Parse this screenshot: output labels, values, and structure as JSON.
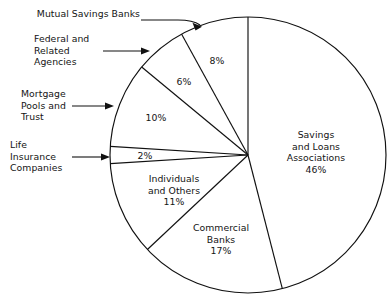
{
  "figure": {
    "background_color": "#ffffff",
    "line_color": "#111111",
    "text_color": "#141414"
  },
  "chart_data": {
    "type": "pie",
    "title": "",
    "xlabel": "",
    "ylabel": "",
    "legend_position": "none",
    "grid": false,
    "start_angle_deg": 0,
    "direction": "clockwise",
    "center": {
      "x": 248,
      "y": 155
    },
    "radius": 138,
    "total_percent": 100,
    "categories": [
      "Savings and Loans Associations",
      "Commercial Banks",
      "Individuals and Others",
      "Life Insurance Companies",
      "Mortgage Pools and Trust",
      "Federal and Related Agencies",
      "Mutual Savings Banks"
    ],
    "values": [
      46,
      17,
      11,
      2,
      10,
      6,
      8
    ],
    "slices": [
      {
        "name": "Savings and Loans Associations",
        "value": 46,
        "percent_label": "46%",
        "label_lines": [
          "Savings",
          "and Loans",
          "Associations",
          "46%"
        ],
        "label_placement": "inside"
      },
      {
        "name": "Commercial Banks",
        "value": 17,
        "percent_label": "17%",
        "label_lines": [
          "Commercial",
          "Banks",
          "17%"
        ],
        "label_placement": "inside"
      },
      {
        "name": "Individuals and Others",
        "value": 11,
        "percent_label": "11%",
        "label_lines": [
          "Individuals",
          "and Others",
          "11%"
        ],
        "label_placement": "inside"
      },
      {
        "name": "Life Insurance Companies",
        "value": 2,
        "percent_label": "2%",
        "label_lines": [
          "2%"
        ],
        "label_placement": "inside-callout",
        "callout_lines": [
          "Life",
          "Insurance",
          "Companies"
        ]
      },
      {
        "name": "Mortgage Pools and Trust",
        "value": 10,
        "percent_label": "10%",
        "label_lines": [
          "10%"
        ],
        "label_placement": "inside-callout",
        "callout_lines": [
          "Mortgage",
          "Pools and",
          "Trust"
        ]
      },
      {
        "name": "Federal and Related Agencies",
        "value": 6,
        "percent_label": "6%",
        "label_lines": [
          "6%"
        ],
        "label_placement": "inside-callout",
        "callout_lines": [
          "Federal and",
          "Related",
          "Agencies"
        ]
      },
      {
        "name": "Mutual Savings Banks",
        "value": 8,
        "percent_label": "8%",
        "label_lines": [
          "8%"
        ],
        "label_placement": "inside-callout",
        "callout_lines": [
          "Mutual Savings Banks"
        ]
      }
    ]
  },
  "callouts": {
    "mutual_savings_banks": {
      "lines": [
        "Mutual Savings Banks"
      ]
    },
    "federal_related_agencies": {
      "lines": [
        "Federal and",
        "Related",
        "Agencies"
      ]
    },
    "mortgage_pools_trust": {
      "lines": [
        "Mortgage",
        "Pools and",
        "Trust"
      ]
    },
    "life_insurance_companies": {
      "lines": [
        "Life",
        "Insurance",
        "Companies"
      ]
    }
  },
  "inside_labels": {
    "savings_loans": {
      "lines": [
        "Savings",
        "and Loans",
        "Associations",
        "46%"
      ]
    },
    "commercial_banks": {
      "lines": [
        "Commercial",
        "Banks",
        "17%"
      ]
    },
    "individuals_others": {
      "lines": [
        "Individuals",
        "and Others",
        "11%"
      ]
    },
    "pct_8": {
      "text": "8%"
    },
    "pct_6": {
      "text": "6%"
    },
    "pct_10": {
      "text": "10%"
    },
    "pct_2": {
      "text": "2%"
    }
  }
}
